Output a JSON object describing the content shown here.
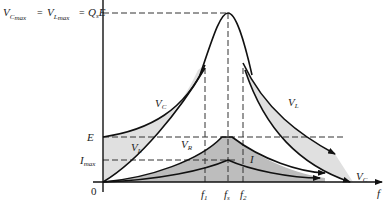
{
  "figure": {
    "title_formula": {
      "vc": "V",
      "vc_sub": "C",
      "vc_subsub": "max",
      "eq1": "=",
      "vl": "V",
      "vl_sub": "L",
      "vl_subsub": "max",
      "eq2": "=",
      "q": "Q",
      "q_sub": "s",
      "e": "E"
    },
    "y_axis": {
      "labels": {
        "E": "E",
        "Imax_main": "I",
        "Imax_sub": "max",
        "origin": "0"
      }
    },
    "x_axis": {
      "label": "f",
      "ticks": [
        {
          "main": "f",
          "sub": "1"
        },
        {
          "main": "f",
          "sub": "s"
        },
        {
          "main": "f",
          "sub": "2"
        }
      ]
    },
    "curve_labels": {
      "vc_left": {
        "main": "V",
        "sub": "C"
      },
      "vl_left": {
        "main": "V",
        "sub": "L"
      },
      "vr": {
        "main": "V",
        "sub": "R"
      },
      "i": {
        "main": "I"
      },
      "vl_right": {
        "main": "V",
        "sub": "L"
      },
      "vc_right": {
        "main": "V",
        "sub": "C"
      }
    },
    "colors": {
      "light_fill": "#e0e0e0",
      "dark_fill": "#bdbdbd",
      "line": "#111111"
    }
  }
}
